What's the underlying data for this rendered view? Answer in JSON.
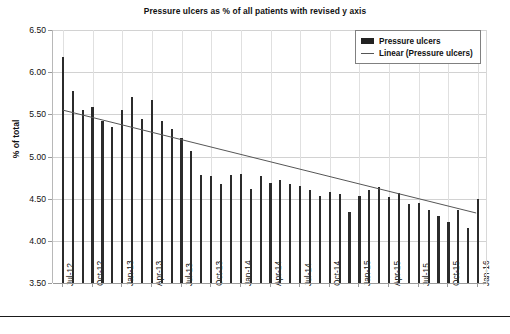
{
  "chart_data": {
    "type": "bar",
    "title": "Pressure ulcers as % of all patients with revised y axis",
    "xlabel": "",
    "ylabel": "% of total",
    "ylim": [
      3.5,
      6.5
    ],
    "ytick_step": 0.5,
    "ytick_labels": [
      "6.50",
      "6.00",
      "5.50",
      "5.00",
      "4.50",
      "4.00",
      "3.50"
    ],
    "ytick_values": [
      6.5,
      6.0,
      5.5,
      5.0,
      4.5,
      4.0,
      3.5
    ],
    "grid": "horizontal-and-vertical",
    "legend_position": "top-right",
    "legend": [
      "Pressure ulcers",
      "Linear (Pressure ulcers)"
    ],
    "bar_color": "#2b2b2b",
    "trend_color": "#555555",
    "xtick_labels": [
      "Jul-12",
      "Oct-12",
      "Jan-13",
      "Apr-13",
      "Jul-13",
      "Oct-13",
      "Jan-14",
      "Apr-14",
      "Jul-14",
      "Oct-14",
      "Jan-15",
      "Apr-15",
      "Jul-15",
      "Oct-15",
      "Jan-16"
    ],
    "xtick_interval_months": 3,
    "categories": [
      "Jul-12",
      "Aug-12",
      "Sep-12",
      "Oct-12",
      "Nov-12",
      "Dec-12",
      "Jan-13",
      "Feb-13",
      "Mar-13",
      "Apr-13",
      "May-13",
      "Jun-13",
      "Jul-13",
      "Aug-13",
      "Sep-13",
      "Oct-13",
      "Nov-13",
      "Dec-13",
      "Jan-14",
      "Feb-14",
      "Mar-14",
      "Apr-14",
      "May-14",
      "Jun-14",
      "Jul-14",
      "Aug-14",
      "Sep-14",
      "Oct-14",
      "Nov-14",
      "Dec-14",
      "Jan-15",
      "Feb-15",
      "Mar-15",
      "Apr-15",
      "May-15",
      "Jun-15",
      "Jul-15",
      "Aug-15",
      "Sep-15",
      "Oct-15",
      "Nov-15",
      "Dec-15",
      "Jan-16"
    ],
    "series": [
      {
        "name": "Pressure ulcers",
        "type": "bar",
        "values": [
          6.18,
          5.78,
          5.55,
          5.59,
          5.42,
          5.35,
          5.55,
          5.7,
          5.44,
          5.67,
          5.42,
          5.33,
          5.22,
          5.06,
          4.78,
          4.77,
          4.67,
          4.78,
          4.79,
          4.62,
          4.77,
          4.69,
          4.72,
          4.67,
          4.65,
          4.6,
          4.53,
          4.58,
          4.56,
          4.34,
          4.53,
          4.6,
          4.64,
          4.52,
          4.57,
          4.44,
          4.45,
          4.36,
          4.29,
          4.22,
          4.36,
          4.15,
          4.5
        ]
      },
      {
        "name": "Linear (Pressure ulcers)",
        "type": "line",
        "trend_start": 5.55,
        "trend_end": 4.33
      }
    ]
  },
  "legend": {
    "bar_label": "Pressure ulcers",
    "line_label": "Linear (Pressure ulcers)"
  },
  "footer": {
    "text": ""
  }
}
